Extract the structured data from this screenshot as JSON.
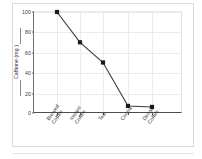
{
  "chart_data": {
    "type": "line",
    "title": "",
    "xlabel": "",
    "ylabel": "Caffeine (mg )",
    "categories": [
      "Brewed\nCoffee",
      "Instant\nCoffee",
      "Tea",
      "Cocoa",
      "Decaf\nCoffee"
    ],
    "values": [
      100,
      70,
      50,
      7,
      6
    ],
    "ylim": [
      0,
      100
    ],
    "yticks": [
      0,
      20,
      40,
      60,
      80,
      100
    ],
    "ytick_labels": [
      "0",
      "20",
      "40",
      "60",
      "80",
      "100"
    ],
    "grid": true,
    "legend": "none",
    "marker": "square",
    "line_color": "#3c3c3c",
    "marker_color": "#1a1a1a",
    "grid_color": "#ebebeb",
    "axis_color": "#4d4d4d",
    "frame_color": "#d9d9d9",
    "background": "#ffffff"
  }
}
